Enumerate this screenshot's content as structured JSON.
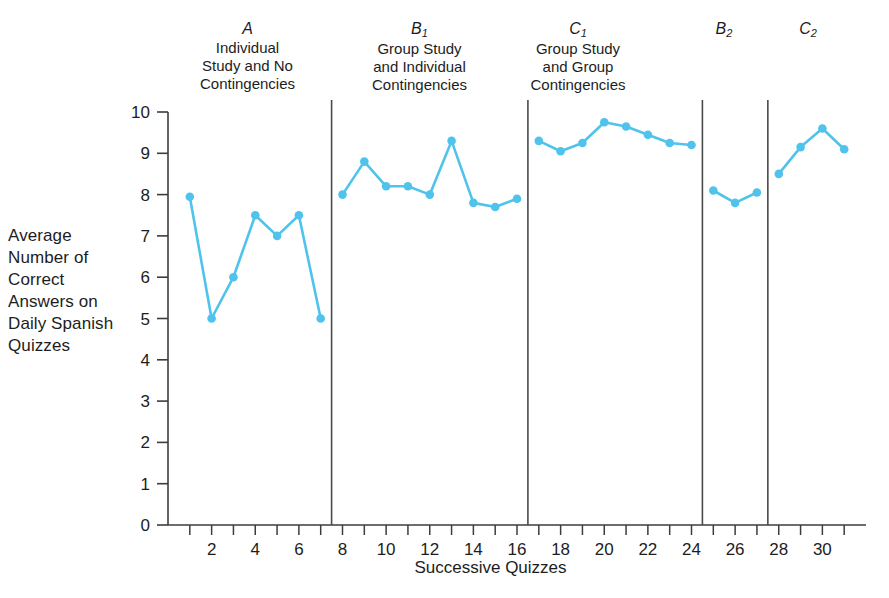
{
  "chart_data": {
    "type": "line",
    "title": "",
    "xlabel": "Successive Quizzes",
    "ylabel": "Average Number of Correct Answers on Daily Spanish Quizzes",
    "xlim": [
      0,
      32
    ],
    "ylim": [
      0,
      10
    ],
    "grid": false,
    "legend": "none",
    "line_color": "#4FC3EC",
    "marker_color": "#4FC3EC",
    "y_ticks": [
      0,
      1,
      2,
      3,
      4,
      5,
      6,
      7,
      8,
      9,
      10
    ],
    "y_tick_labels": [
      "0",
      "1",
      "2",
      "3",
      "4",
      "5",
      "6",
      "7",
      "8",
      "9",
      "10"
    ],
    "x_ticks": [
      1,
      2,
      3,
      4,
      5,
      6,
      7,
      8,
      9,
      10,
      11,
      12,
      13,
      14,
      15,
      16,
      17,
      18,
      19,
      20,
      21,
      22,
      23,
      24,
      25,
      26,
      27,
      28,
      29,
      30,
      31
    ],
    "x_tick_labels_shown": [
      "2",
      "4",
      "6",
      "8",
      "10",
      "12",
      "14",
      "16",
      "18",
      "20",
      "22",
      "24",
      "26",
      "28",
      "30"
    ],
    "phase_divider_x": [
      7.5,
      16.5,
      24.5,
      27.5
    ],
    "series": [
      {
        "name": "Average correct answers",
        "x": [
          1,
          2,
          3,
          4,
          5,
          6,
          7,
          8,
          9,
          10,
          11,
          12,
          13,
          14,
          15,
          16,
          17,
          18,
          19,
          20,
          21,
          22,
          23,
          24,
          25,
          26,
          27,
          28,
          29,
          30,
          31
        ],
        "values": [
          7.95,
          5.0,
          6.0,
          7.5,
          7.0,
          7.5,
          5.0,
          8.0,
          8.8,
          8.2,
          8.2,
          8.0,
          9.3,
          7.8,
          7.7,
          7.9,
          9.3,
          9.05,
          9.25,
          9.75,
          9.65,
          9.45,
          9.25,
          9.2,
          8.1,
          7.8,
          8.05,
          8.5,
          9.15,
          9.6,
          9.1
        ]
      }
    ],
    "phases": [
      {
        "code": "A",
        "subscript": "",
        "description": "Individual\nStudy and No\nContingencies",
        "x_start": 1,
        "x_end": 7,
        "values": [
          7.95,
          5.0,
          6.0,
          7.5,
          7.0,
          7.5,
          5.0
        ]
      },
      {
        "code": "B",
        "subscript": "1",
        "description": "Group Study\nand Individual\nContingencies",
        "x_start": 8,
        "x_end": 16,
        "values": [
          8.0,
          8.8,
          8.2,
          8.2,
          8.0,
          9.3,
          7.8,
          7.7,
          7.9
        ]
      },
      {
        "code": "C",
        "subscript": "1",
        "description": "Group Study\nand Group\nContingencies",
        "x_start": 17,
        "x_end": 24,
        "values": [
          9.3,
          9.05,
          9.25,
          9.75,
          9.65,
          9.45,
          9.25,
          9.2
        ]
      },
      {
        "code": "B",
        "subscript": "2",
        "description": "",
        "x_start": 25,
        "x_end": 27,
        "values": [
          8.1,
          7.8,
          8.05
        ]
      },
      {
        "code": "C",
        "subscript": "2",
        "description": "",
        "x_start": 28,
        "x_end": 31,
        "values": [
          8.5,
          9.15,
          9.6,
          9.1
        ]
      }
    ]
  },
  "axis": {
    "y_title": "Average Number of Correct Answers on Daily Spanish Quizzes",
    "x_title": "Successive Quizzes"
  }
}
